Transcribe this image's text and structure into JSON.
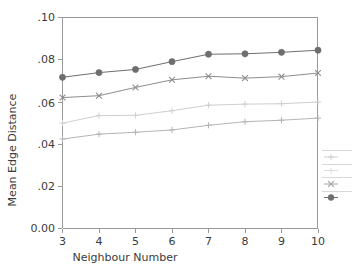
{
  "chart_data": {
    "type": "line",
    "title": "",
    "xlabel": "Neighbour Number",
    "ylabel": "Mean Edge Distance",
    "x": [
      3,
      4,
      5,
      6,
      7,
      8,
      9,
      10
    ],
    "xtick_labels": [
      "3",
      "4",
      "5",
      "6",
      "7",
      "8",
      "9",
      "10"
    ],
    "ytick_labels": [
      "0.00",
      ".02",
      ".04",
      ".06",
      ".08",
      ".10"
    ],
    "ytick_values": [
      0.0,
      0.02,
      0.04,
      0.06,
      0.08,
      0.1
    ],
    "xlim": [
      3,
      10
    ],
    "ylim": [
      0.0,
      0.1
    ],
    "grid": false,
    "legend_position": "right-outside-cropped",
    "series": [
      {
        "name": "series-4",
        "marker": "plus",
        "color": "#b4b4b4",
        "values": [
          0.0423,
          0.0446,
          0.0455,
          0.0466,
          0.0488,
          0.0505,
          0.0512,
          0.0522
        ]
      },
      {
        "name": "series-3",
        "marker": "plus",
        "color": "#cfcfcf",
        "values": [
          0.0498,
          0.0534,
          0.0535,
          0.0557,
          0.0583,
          0.0588,
          0.059,
          0.0598
        ]
      },
      {
        "name": "series-2",
        "marker": "cross",
        "color": "#8d8d8d",
        "values": [
          0.0619,
          0.0628,
          0.0667,
          0.0703,
          0.072,
          0.0711,
          0.0718,
          0.0735
        ]
      },
      {
        "name": "series-1",
        "marker": "filled-circle",
        "color": "#6e6e6e",
        "values": [
          0.0715,
          0.0737,
          0.0752,
          0.0789,
          0.0824,
          0.0826,
          0.0833,
          0.0843
        ]
      }
    ],
    "legend_entries": [
      {
        "marker": "plus",
        "color": "#cfcfcf",
        "label": ""
      },
      {
        "marker": "plus",
        "color": "#dcdcdc",
        "label": ""
      },
      {
        "marker": "cross",
        "color": "#a8a8a8",
        "label": ""
      },
      {
        "marker": "filled-circle",
        "color": "#6e6e6e",
        "label": ""
      }
    ]
  },
  "axes": {
    "y_title": "Mean Edge Distance",
    "x_title": "Neighbour Number",
    "ytick_0": "0.00",
    "ytick_1": ".02",
    "ytick_2": ".04",
    "ytick_3": ".06",
    "ytick_4": ".08",
    "ytick_5": ".10",
    "xtick_0": "3",
    "xtick_1": "4",
    "xtick_2": "5",
    "xtick_3": "6",
    "xtick_4": "7",
    "xtick_5": "8",
    "xtick_6": "9",
    "xtick_7": "10"
  },
  "colors": {
    "axis": "#9a9a9a",
    "text": "#3b3b3b",
    "background": "#ffffff"
  }
}
